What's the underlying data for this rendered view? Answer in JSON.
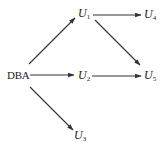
{
  "diagram": {
    "type": "directed-graph",
    "nodes": [
      {
        "id": "DBA",
        "label": "DBA",
        "x": 7,
        "y": 70
      },
      {
        "id": "U1",
        "label": "U",
        "sub": "1",
        "x": 78,
        "y": 8
      },
      {
        "id": "U4",
        "label": "U",
        "sub": "4",
        "x": 144,
        "y": 9
      },
      {
        "id": "U2",
        "label": "U",
        "sub": "2",
        "x": 78,
        "y": 70
      },
      {
        "id": "U5",
        "label": "U",
        "sub": "5",
        "x": 144,
        "y": 70
      },
      {
        "id": "U3",
        "label": "U",
        "sub": "3",
        "x": 74,
        "y": 130
      }
    ],
    "edges": [
      {
        "from": "DBA",
        "to": "U1"
      },
      {
        "from": "DBA",
        "to": "U2"
      },
      {
        "from": "DBA",
        "to": "U3"
      },
      {
        "from": "U1",
        "to": "U4"
      },
      {
        "from": "U1",
        "to": "U5"
      },
      {
        "from": "U2",
        "to": "U5"
      }
    ],
    "colors": {
      "stroke": "#333333",
      "text": "#222222",
      "background": "#ffffff"
    }
  }
}
